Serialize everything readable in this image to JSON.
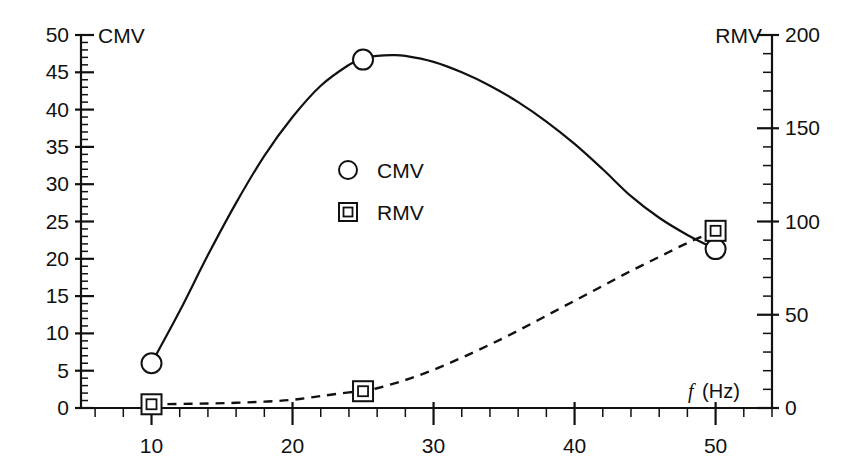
{
  "chart_data": {
    "type": "line",
    "title": "",
    "subtitle": "",
    "xlabel_symbol": "f",
    "xlabel_unit": " (Hz)",
    "xlabel": "f (Hz)",
    "xlim": [
      5,
      54
    ],
    "x_major_ticks": [
      10,
      20,
      30,
      40,
      50
    ],
    "x_major_tick_labels": [
      "10",
      "20",
      "30",
      "40",
      "50"
    ],
    "x_minor_tick_step": 2,
    "grid": false,
    "legend_position": "center",
    "axes": [
      {
        "id": "left",
        "name": "CMV",
        "title": "CMV",
        "side": "left",
        "lim": [
          0,
          50
        ],
        "major_ticks": [
          0,
          5,
          10,
          15,
          20,
          25,
          30,
          35,
          40,
          45,
          50
        ],
        "major_tick_labels": [
          "0",
          "5",
          "10",
          "15",
          "20",
          "25",
          "30",
          "35",
          "40",
          "45",
          "50"
        ],
        "minor_tick_step": 1
      },
      {
        "id": "right",
        "name": "RMV",
        "title": "RMV",
        "side": "right",
        "lim": [
          0,
          200
        ],
        "major_ticks": [
          0,
          50,
          100,
          150,
          200
        ],
        "major_tick_labels": [
          "0",
          "50",
          "100",
          "150",
          "200"
        ],
        "minor_tick_step": 10
      }
    ],
    "series": [
      {
        "name": "CMV",
        "axis": "left",
        "marker": "circle",
        "linestyle": "solid",
        "color": "#111111",
        "x": [
          10,
          25,
          50
        ],
        "values": [
          6.0,
          46.7,
          21.3
        ],
        "curve_x": [
          10,
          12,
          14,
          16,
          18,
          20,
          22,
          24,
          25,
          26,
          27,
          28,
          30,
          32,
          34,
          36,
          38,
          40,
          42,
          44,
          46,
          48,
          50
        ],
        "curve_y": [
          6.0,
          13.0,
          20.5,
          27.5,
          33.8,
          39.0,
          43.2,
          46.0,
          46.9,
          47.2,
          47.3,
          47.2,
          46.4,
          45.0,
          43.2,
          41.0,
          38.4,
          35.4,
          32.0,
          28.4,
          25.5,
          23.2,
          21.3
        ]
      },
      {
        "name": "RMV",
        "axis": "right",
        "marker": "square",
        "linestyle": "dashed",
        "color": "#111111",
        "x": [
          10,
          25,
          50
        ],
        "values": [
          2.0,
          9.0,
          95.0
        ],
        "curve_x": [
          10,
          14,
          16,
          18,
          20,
          22,
          24,
          25,
          26,
          28,
          30,
          32,
          34,
          36,
          38,
          40,
          42,
          44,
          46,
          48,
          50
        ],
        "curve_y": [
          2.0,
          2.4,
          2.8,
          3.4,
          4.4,
          6.4,
          8.4,
          9.0,
          10.6,
          15.0,
          20.5,
          27.0,
          34.0,
          41.5,
          49.5,
          57.5,
          65.5,
          73.5,
          81.0,
          88.5,
          95.0
        ]
      }
    ],
    "legend": [
      {
        "label": "CMV",
        "marker": "circle"
      },
      {
        "label": "RMV",
        "marker": "square"
      }
    ]
  }
}
